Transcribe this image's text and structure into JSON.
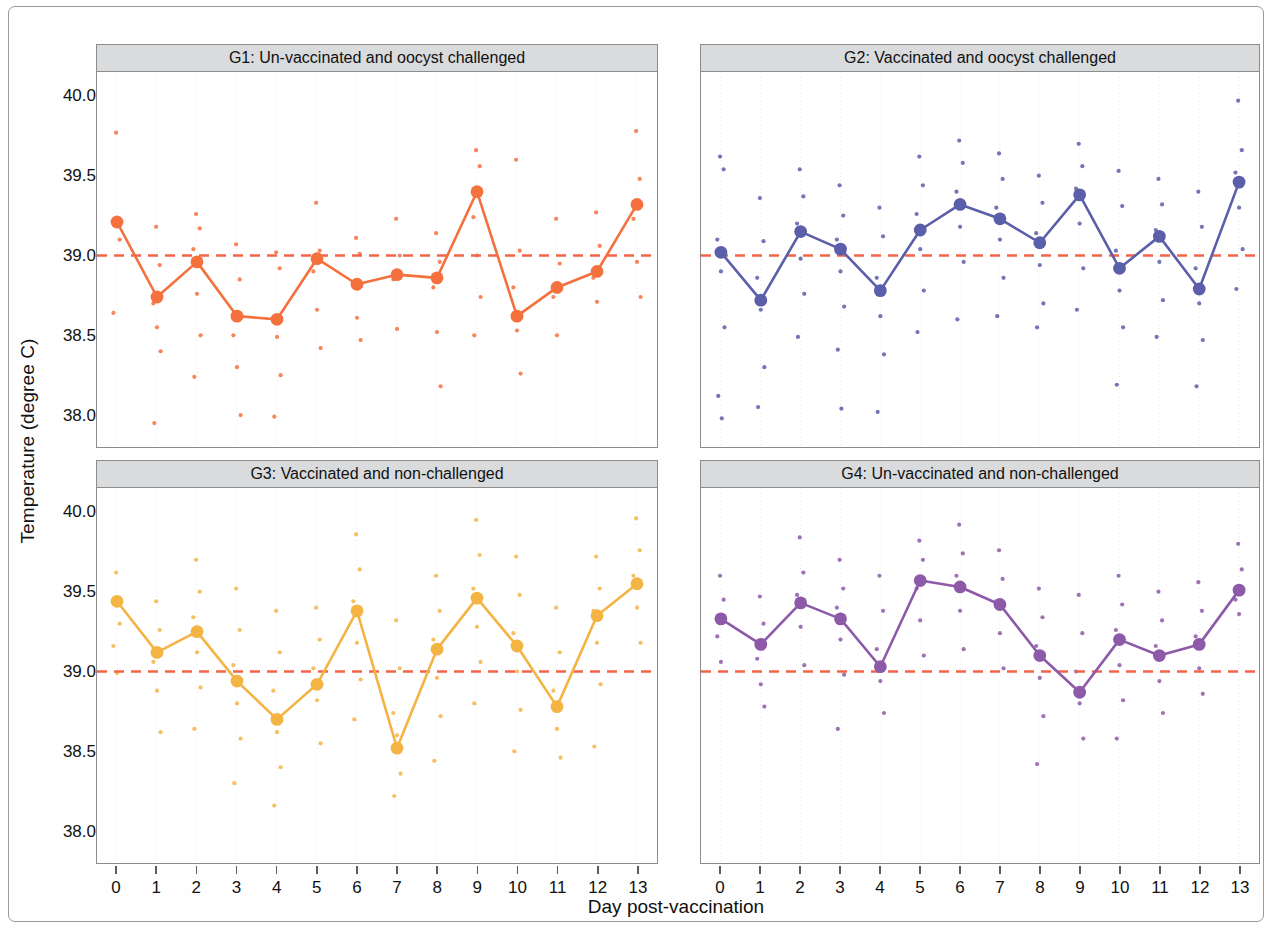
{
  "figure": {
    "xlabel": "Day post-vaccination",
    "ylabel": "Temperature (degree C)"
  },
  "chart_data": {
    "type": "line",
    "title": "",
    "xlabel": "Day post-vaccination",
    "ylabel": "Temperature (degree C)",
    "x": [
      0,
      1,
      2,
      3,
      4,
      5,
      6,
      7,
      8,
      9,
      10,
      11,
      12,
      13
    ],
    "xtick_labels": [
      "0",
      "1",
      "2",
      "3",
      "4",
      "5",
      "6",
      "7",
      "8",
      "9",
      "10",
      "11",
      "12",
      "13"
    ],
    "ytick_labels": [
      "38.0",
      "38.5",
      "39.0",
      "39.5",
      "40.0"
    ],
    "ytick_values": [
      38.0,
      38.5,
      39.0,
      39.5,
      40.0
    ],
    "xlim": [
      -0.5,
      13.5
    ],
    "ylim": [
      37.8,
      40.15
    ],
    "grid": false,
    "legend": "none",
    "reference_line": {
      "value": 39.0,
      "style": "dashed",
      "color": "#F4644A",
      "label": "39.0"
    },
    "panels": [
      {
        "id": "G1",
        "title": "G1: Un-vaccinated and oocyst challenged",
        "color": "#F4703C",
        "series": [
          {
            "name": "mean",
            "values": [
              39.21,
              38.74,
              38.96,
              38.62,
              38.6,
              38.98,
              38.82,
              38.88,
              38.86,
              39.4,
              38.62,
              38.8,
              38.9,
              39.32
            ]
          }
        ],
        "points": [
          [
            39.21,
            39.77,
            39.1,
            38.64
          ],
          [
            38.74,
            39.18,
            38.94,
            38.7,
            38.55,
            38.4,
            37.95
          ],
          [
            38.96,
            39.26,
            39.17,
            39.04,
            38.76,
            38.5,
            38.24
          ],
          [
            38.62,
            39.07,
            38.85,
            38.5,
            38.3,
            38.0
          ],
          [
            38.6,
            39.02,
            38.92,
            38.61,
            38.49,
            38.25,
            37.99
          ],
          [
            38.98,
            39.33,
            39.03,
            38.9,
            38.66,
            38.42
          ],
          [
            38.82,
            39.11,
            39.01,
            38.83,
            38.61,
            38.47
          ],
          [
            38.88,
            39.23,
            39.0,
            38.85,
            38.54
          ],
          [
            38.86,
            39.14,
            38.96,
            38.8,
            38.52,
            38.18
          ],
          [
            39.4,
            39.66,
            39.56,
            39.24,
            39.0,
            38.74,
            38.5
          ],
          [
            38.62,
            39.6,
            39.03,
            38.8,
            38.53,
            38.26
          ],
          [
            38.8,
            39.23,
            38.95,
            38.74,
            38.5
          ],
          [
            38.9,
            39.27,
            39.06,
            38.86,
            38.71
          ],
          [
            39.32,
            39.78,
            39.48,
            39.23,
            38.96,
            38.74
          ]
        ]
      },
      {
        "id": "G2",
        "title": "G2: Vaccinated and oocyst challenged",
        "color": "#5B5EA8",
        "series": [
          {
            "name": "mean",
            "values": [
              39.02,
              38.72,
              39.15,
              39.04,
              38.78,
              39.16,
              39.32,
              39.23,
              39.08,
              39.38,
              38.92,
              39.12,
              38.79,
              39.46
            ]
          }
        ],
        "points": [
          [
            39.02,
            39.62,
            39.54,
            39.1,
            38.9,
            38.55,
            38.12,
            37.98
          ],
          [
            38.72,
            39.36,
            39.09,
            38.86,
            38.66,
            38.3,
            38.05
          ],
          [
            39.15,
            39.54,
            39.37,
            39.2,
            38.98,
            38.76,
            38.49
          ],
          [
            39.04,
            39.44,
            39.25,
            39.1,
            38.9,
            38.68,
            38.41,
            38.04
          ],
          [
            38.78,
            39.3,
            39.12,
            38.86,
            38.62,
            38.38,
            38.02
          ],
          [
            39.16,
            39.62,
            39.44,
            39.26,
            39.04,
            38.78,
            38.52
          ],
          [
            39.32,
            39.72,
            39.58,
            39.4,
            39.18,
            38.96,
            38.6
          ],
          [
            39.23,
            39.64,
            39.48,
            39.3,
            39.1,
            38.86,
            38.62
          ],
          [
            39.08,
            39.5,
            39.33,
            39.14,
            38.94,
            38.7,
            38.55
          ],
          [
            39.38,
            39.7,
            39.56,
            39.42,
            39.2,
            38.92,
            38.66
          ],
          [
            38.92,
            39.53,
            39.31,
            39.03,
            38.78,
            38.55,
            38.19
          ],
          [
            39.12,
            39.48,
            39.32,
            39.16,
            38.96,
            38.72,
            38.49
          ],
          [
            38.79,
            39.4,
            39.18,
            38.92,
            38.7,
            38.47,
            38.18
          ],
          [
            39.46,
            39.97,
            39.66,
            39.52,
            39.3,
            39.04,
            38.79
          ]
        ]
      },
      {
        "id": "G3",
        "title": "G3: Vaccinated and non-challenged",
        "color": "#F4B444",
        "series": [
          {
            "name": "mean",
            "values": [
              39.44,
              39.12,
              39.25,
              38.94,
              38.7,
              38.92,
              39.38,
              38.52,
              39.14,
              39.46,
              39.16,
              38.78,
              39.35,
              39.55
            ]
          }
        ],
        "points": [
          [
            39.44,
            39.62,
            39.3,
            39.16,
            38.99
          ],
          [
            39.12,
            39.44,
            39.26,
            39.06,
            38.88,
            38.62
          ],
          [
            39.25,
            39.7,
            39.5,
            39.34,
            39.12,
            38.9,
            38.64
          ],
          [
            38.94,
            39.52,
            39.26,
            39.04,
            38.8,
            38.58,
            38.3
          ],
          [
            38.7,
            39.38,
            39.12,
            38.88,
            38.62,
            38.4,
            38.16
          ],
          [
            38.92,
            39.4,
            39.2,
            39.02,
            38.82,
            38.55
          ],
          [
            39.38,
            39.86,
            39.64,
            39.44,
            39.18,
            38.95,
            38.7
          ],
          [
            38.52,
            39.32,
            39.02,
            38.74,
            38.6,
            38.36,
            38.22
          ],
          [
            39.14,
            39.6,
            39.38,
            39.2,
            38.96,
            38.72,
            38.44
          ],
          [
            39.46,
            39.95,
            39.73,
            39.52,
            39.28,
            39.06,
            38.8
          ],
          [
            39.16,
            39.72,
            39.48,
            39.24,
            39.0,
            38.76,
            38.5
          ],
          [
            38.78,
            39.4,
            39.12,
            38.88,
            38.64,
            38.46
          ],
          [
            39.35,
            39.72,
            39.52,
            39.38,
            39.18,
            38.92,
            38.53
          ],
          [
            39.55,
            39.96,
            39.76,
            39.6,
            39.4,
            39.18
          ]
        ]
      },
      {
        "id": "G4",
        "title": "G4: Un-vaccinated and non-challenged",
        "color": "#8C5AA8",
        "series": [
          {
            "name": "mean",
            "values": [
              39.33,
              39.17,
              39.43,
              39.33,
              39.03,
              39.57,
              39.53,
              39.42,
              39.1,
              38.87,
              39.2,
              39.1,
              39.17,
              39.51
            ]
          }
        ],
        "points": [
          [
            39.33,
            39.6,
            39.45,
            39.22,
            39.06
          ],
          [
            39.17,
            39.47,
            39.3,
            39.08,
            38.92,
            38.78
          ],
          [
            39.43,
            39.84,
            39.62,
            39.48,
            39.28,
            39.04
          ],
          [
            39.33,
            39.7,
            39.52,
            39.4,
            39.2,
            38.98,
            38.64
          ],
          [
            39.03,
            39.6,
            39.38,
            39.14,
            38.94,
            38.74
          ],
          [
            39.57,
            39.82,
            39.7,
            39.52,
            39.32,
            39.1
          ],
          [
            39.53,
            39.92,
            39.74,
            39.6,
            39.38,
            39.14
          ],
          [
            39.42,
            39.76,
            39.58,
            39.44,
            39.24,
            39.02
          ],
          [
            39.1,
            39.52,
            39.34,
            39.16,
            38.96,
            38.72,
            38.42
          ],
          [
            38.87,
            39.48,
            39.24,
            39.0,
            38.8,
            38.58
          ],
          [
            39.2,
            39.6,
            39.42,
            39.26,
            39.04,
            38.82,
            38.58
          ],
          [
            39.1,
            39.5,
            39.32,
            39.16,
            38.94,
            38.74
          ],
          [
            39.17,
            39.56,
            39.38,
            39.22,
            39.02,
            38.86
          ],
          [
            39.51,
            39.8,
            39.64,
            39.45,
            39.36
          ]
        ]
      }
    ]
  }
}
